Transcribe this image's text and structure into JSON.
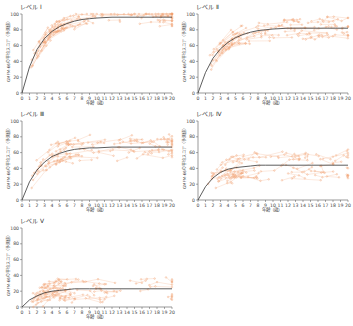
{
  "figure": {
    "xlabel": "年齢（歳）",
    "ylabel": "GMFM-66の平均スコア（予測値）",
    "xticks": [
      "0",
      "1",
      "2",
      "3",
      "4",
      "5",
      "6",
      "7",
      "8",
      "9",
      "10",
      "11",
      "12",
      "13",
      "14",
      "15",
      "16",
      "17",
      "18",
      "19",
      "20"
    ],
    "yticks": [
      "0",
      "20",
      "40",
      "60",
      "80",
      "100"
    ],
    "point_color": "#f0a070",
    "line_color": "#f4b088",
    "curve_color": "#333333"
  },
  "panels": [
    {
      "title": "レベル Ⅰ",
      "plateau": 96,
      "rate": 0.42,
      "spread": 10
    },
    {
      "title": "レベル Ⅱ",
      "plateau": 82,
      "rate": 0.38,
      "spread": 12
    },
    {
      "title": "レベル Ⅲ",
      "plateau": 67,
      "rate": 0.42,
      "spread": 14
    },
    {
      "title": "レベル Ⅳ",
      "plateau": 44,
      "rate": 0.5,
      "spread": 16
    },
    {
      "title": "レベル Ⅴ",
      "plateau": 23,
      "rate": 0.45,
      "spread": 14
    }
  ],
  "chart_data": [
    {
      "type": "scatter",
      "title": "レベル Ⅰ",
      "xlabel": "年齢（歳）",
      "ylabel": "GMFM-66の平均スコア（予測値）",
      "xlim": [
        0,
        20
      ],
      "ylim": [
        0,
        100
      ],
      "curve": {
        "x": [
          0,
          1,
          2,
          3,
          4,
          5,
          6,
          7,
          8,
          9,
          10,
          12,
          14,
          16,
          18,
          20
        ],
        "y": [
          0,
          33,
          55,
          69,
          78,
          84,
          88,
          91,
          93,
          94,
          95,
          96,
          96,
          96,
          96,
          96
        ]
      },
      "grid": false,
      "legend": null
    },
    {
      "type": "scatter",
      "title": "レベル Ⅱ",
      "xlabel": "年齢（歳）",
      "ylabel": "GMFM-66の平均スコア（予測値）",
      "xlim": [
        0,
        20
      ],
      "ylim": [
        0,
        100
      ],
      "curve": {
        "x": [
          0,
          1,
          2,
          3,
          4,
          5,
          6,
          7,
          8,
          9,
          10,
          12,
          14,
          16,
          18,
          20
        ],
        "y": [
          0,
          26,
          44,
          56,
          64,
          70,
          74,
          77,
          79,
          80,
          81,
          82,
          82,
          82,
          82,
          82
        ]
      },
      "grid": false,
      "legend": null
    },
    {
      "type": "scatter",
      "title": "レベル Ⅲ",
      "xlabel": "年齢（歳）",
      "ylabel": "GMFM-66の平均スコア（予測値）",
      "xlim": [
        0,
        20
      ],
      "ylim": [
        0,
        100
      ],
      "curve": {
        "x": [
          0,
          1,
          2,
          3,
          4,
          5,
          6,
          7,
          8,
          9,
          10,
          12,
          14,
          16,
          18,
          20
        ],
        "y": [
          0,
          23,
          38,
          48,
          55,
          59,
          62,
          64,
          65,
          66,
          66,
          67,
          67,
          67,
          67,
          67
        ]
      },
      "grid": false,
      "legend": null
    },
    {
      "type": "scatter",
      "title": "レベル Ⅳ",
      "xlabel": "年齢（歳）",
      "ylabel": "GMFM-66の平均スコア（予測値）",
      "xlim": [
        0,
        20
      ],
      "ylim": [
        0,
        100
      ],
      "curve": {
        "x": [
          0,
          1,
          2,
          3,
          4,
          5,
          6,
          7,
          8,
          9,
          10,
          12,
          14,
          16,
          18,
          20
        ],
        "y": [
          0,
          17,
          28,
          35,
          39,
          41,
          42,
          43,
          44,
          44,
          44,
          44,
          44,
          44,
          44,
          44
        ]
      },
      "grid": false,
      "legend": null
    },
    {
      "type": "scatter",
      "title": "レベル Ⅴ",
      "xlabel": "年齢（歳）",
      "ylabel": "GMFM-66の平均スコア（予測値）",
      "xlim": [
        0,
        20
      ],
      "ylim": [
        0,
        100
      ],
      "curve": {
        "x": [
          0,
          1,
          2,
          3,
          4,
          5,
          6,
          7,
          8,
          9,
          10,
          12,
          14,
          16,
          18,
          20
        ],
        "y": [
          0,
          9,
          14,
          18,
          20,
          21,
          22,
          23,
          23,
          23,
          23,
          23,
          23,
          23,
          23,
          23
        ]
      },
      "grid": false,
      "legend": null
    }
  ]
}
